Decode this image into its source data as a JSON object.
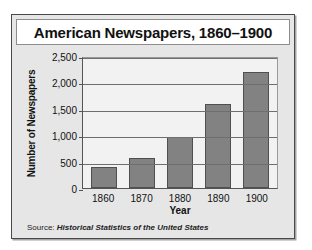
{
  "figure": {
    "title": "American Newspapers, 1860–1900",
    "source_label": "Source:",
    "source_title": "Historical Statistics of the United States"
  },
  "colors": {
    "bar_fill": "#828282",
    "bar_stroke": "#4f4f4f",
    "plot_background": "#f2f2f2",
    "panel_background": "#e6e6e6",
    "frame_border": "#4a4a4a",
    "gridline": "#6e6e6e",
    "text": "#111111"
  },
  "chart_data": {
    "type": "bar",
    "title": "American Newspapers, 1860–1900",
    "xlabel": "Year",
    "ylabel": "Number of Newspapers",
    "categories": [
      "1860",
      "1870",
      "1880",
      "1890",
      "1900"
    ],
    "values": [
      400,
      570,
      960,
      1600,
      2200
    ],
    "ylim": [
      0,
      2500
    ],
    "yticks": [
      0,
      500,
      1000,
      1500,
      2000,
      2500
    ],
    "ytick_labels": [
      "0",
      "500",
      "1,000",
      "1,500",
      "2,000",
      "2,500"
    ],
    "grid": true,
    "legend": null,
    "series": [
      {
        "name": "Number of Newspapers",
        "values": [
          400,
          570,
          960,
          1600,
          2200
        ]
      }
    ]
  }
}
